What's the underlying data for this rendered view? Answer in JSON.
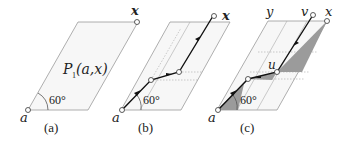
{
  "panels": [
    {
      "id": "a",
      "caption": "(a)",
      "start_label": "a",
      "end_label": "x",
      "region_label_main": "P",
      "region_label_sub": "1",
      "region_label_args": "(a,x)",
      "angle_label": "60°"
    },
    {
      "id": "b",
      "caption": "(b)",
      "start_label": "a",
      "end_label": "x",
      "angle_label": "60°"
    },
    {
      "id": "c",
      "caption": "(c)",
      "start_label": "a",
      "end_label": "x",
      "corner_label": "y",
      "top_node_label": "v",
      "mid_node_label": "u",
      "angle_label": "60°"
    }
  ],
  "colors": {
    "frame": "#9a9a9a",
    "path": "#111111",
    "shade": "#9b9b9b",
    "fill": "#f5f5f5"
  }
}
